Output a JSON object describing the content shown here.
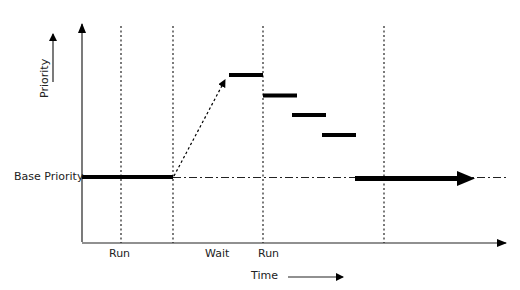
{
  "diagram": {
    "y_axis_label": "Priority",
    "x_axis_label": "Time",
    "base_level_label": "Base Priority",
    "phase_labels": [
      {
        "label": "Run",
        "x": 121
      },
      {
        "label": "Wait",
        "x": 217
      },
      {
        "label": "Run",
        "x": 263
      }
    ],
    "annotations": {
      "boost_arrow": "dotted arrow from end of wait to boosted priority",
      "decay_steps": 4
    },
    "colors": {
      "line": "#000000",
      "text": "#222222",
      "background": "#ffffff"
    }
  }
}
